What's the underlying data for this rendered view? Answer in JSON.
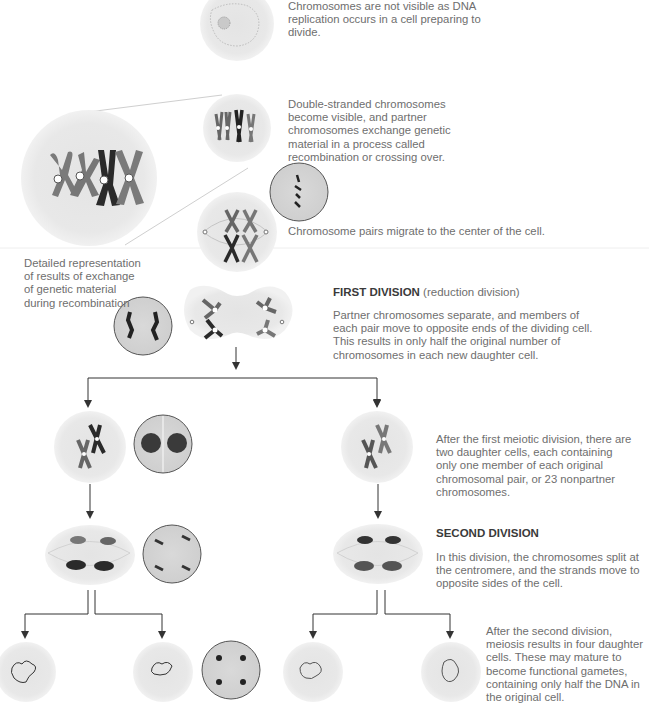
{
  "stages": {
    "interphase": {
      "text": "Chromosomes are not visible as DNA replication occurs in a cell preparing to divide."
    },
    "prophase": {
      "text": "Double-stranded chromosomes become visible, and partner chromosomes exchange genetic material in a process called recombination or crossing over."
    },
    "detail_caption": {
      "text": "Detailed representation of results of exchange of genetic material during recombination"
    },
    "metaphase": {
      "text": "Chromosome pairs migrate to the center of the cell."
    },
    "first_division": {
      "heading": "FIRST DIVISION",
      "subheading": "(reduction division)",
      "text": "Partner chromosomes separate, and members of each pair move to opposite ends of the dividing cell. This results in only half the original number of chromosomes in each new daughter cell."
    },
    "after_first": {
      "text": "After the first meiotic division, there are two daughter cells, each containing only one member of each original chromosomal pair, or 23 nonpartner chromosomes."
    },
    "second_division": {
      "heading": "SECOND DIVISION",
      "text": "In this division, the chromosomes split at the centromere, and the strands move to opposite sides of the cell."
    },
    "after_second": {
      "text": "After the second division, meiosis results in four daughter cells. These may mature to become functional gametes, containing only half the DNA in the original cell."
    }
  },
  "colors": {
    "cell_fill": "#e6e6e6",
    "chromosome_dark": "#2a2a2a",
    "chromosome_gray": "#7a7a7a",
    "arrow": "#333333",
    "text": "#6e6e6e",
    "heading": "#3a3a3a"
  }
}
